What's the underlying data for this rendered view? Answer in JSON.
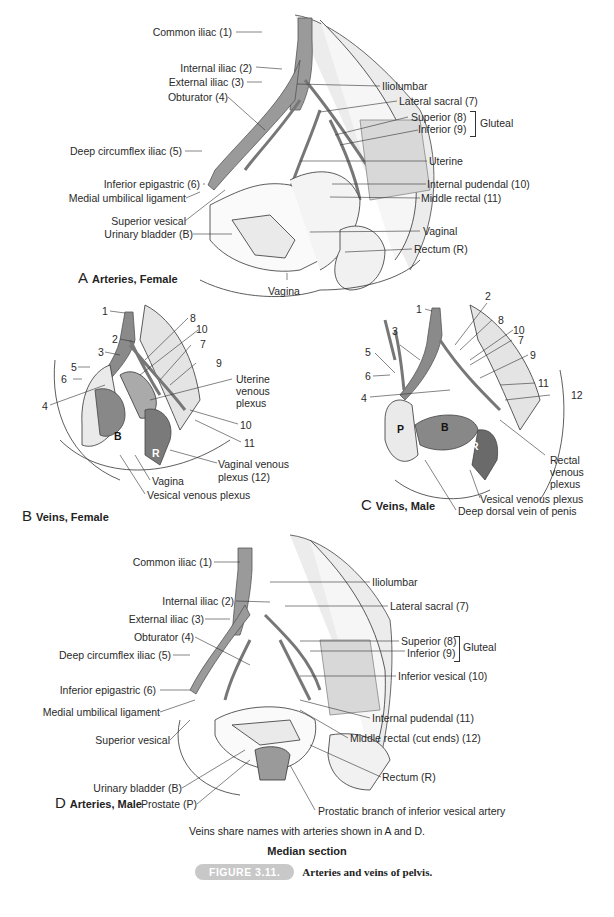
{
  "panels": {
    "A": {
      "letter": "A",
      "title": "Arteries, Female",
      "labels": {
        "common_iliac": "Common iliac (1)",
        "internal_iliac": "Internal iliac (2)",
        "external_iliac": "External iliac (3)",
        "obturator": "Obturator (4)",
        "deep_circumflex_iliac": "Deep circumflex iliac (5)",
        "inferior_epigastric": "Inferior epigastric (6)",
        "medial_umbilical_ligament": "Medial umbilical ligament",
        "superior_vesical": "Superior vesical",
        "urinary_bladder": "Urinary bladder (B)",
        "vagina": "Vagina",
        "iliolumbar": "Iliolumbar",
        "lateral_sacral": "Lateral sacral (7)",
        "gluteal_superior": "Superior (8)",
        "gluteal_inferior": "Inferior (9)",
        "gluteal": "Gluteal",
        "uterine": "Uterine",
        "internal_pudendal": "Internal pudendal (10)",
        "middle_rectal": "Middle rectal (11)",
        "vaginal": "Vaginal",
        "rectum": "Rectum (R)"
      }
    },
    "B": {
      "letter": "B",
      "title": "Veins, Female",
      "numbers": [
        "1",
        "2",
        "3",
        "4",
        "5",
        "6",
        "7",
        "8",
        "9",
        "10",
        "10",
        "11"
      ],
      "labels": {
        "uterine_venous_plexus_1": "Uterine",
        "uterine_venous_plexus_2": "venous",
        "uterine_venous_plexus_3": "plexus",
        "vaginal_venous_plexus_1": "Vaginal venous",
        "vaginal_venous_plexus_2": "plexus (12)",
        "vagina": "Vagina",
        "vesical_venous_plexus": "Vesical venous plexus",
        "bladder_marker": "B",
        "rectum_marker": "R"
      }
    },
    "C": {
      "letter": "C",
      "title": "Veins, Male",
      "numbers": [
        "1",
        "2",
        "3",
        "4",
        "5",
        "6",
        "7",
        "8",
        "9",
        "10",
        "11",
        "12"
      ],
      "labels": {
        "rectal_venous_plexus_1": "Rectal",
        "rectal_venous_plexus_2": "venous",
        "rectal_venous_plexus_3": "plexus",
        "vesical_venous_plexus": "Vesical venous plexus",
        "deep_dorsal_vein": "Deep dorsal vein of penis",
        "prostate_marker": "P",
        "bladder_marker": "B",
        "rectum_marker": "R"
      }
    },
    "D": {
      "letter": "D",
      "title": "Arteries, Male",
      "labels": {
        "common_iliac": "Common iliac (1)",
        "internal_iliac": "Internal iliac (2)",
        "external_iliac": "External iliac (3)",
        "obturator": "Obturator (4)",
        "deep_circumflex_iliac": "Deep circumflex iliac (5)",
        "inferior_epigastric": "Inferior epigastric (6)",
        "medial_umbilical_ligament": "Medial umbilical ligament",
        "superior_vesical": "Superior vesical",
        "urinary_bladder": "Urinary bladder (B)",
        "prostate": "Prostate (P)",
        "iliolumbar": "Iliolumbar",
        "lateral_sacral": "Lateral sacral (7)",
        "gluteal_superior": "Superior (8)",
        "gluteal_inferior": "Inferior (9)",
        "gluteal": "Gluteal",
        "inferior_vesical": "Inferior vesical (10)",
        "internal_pudendal": "Internal pudendal (11)",
        "middle_rectal": "Middle rectal (cut ends) (12)",
        "rectum": "Rectum (R)",
        "prostatic_branch": "Prostatic branch of inferior vesical artery"
      }
    }
  },
  "caption": {
    "note": "Veins share names with arteries shown in A and D.",
    "subtitle": "Median section",
    "figure_badge": "FIGURE 3.11.",
    "figure_title": "Arteries and veins of pelvis."
  },
  "colors": {
    "vessel": "#8a8a8a",
    "vessel_dark": "#5a5a5a",
    "bone": "#e6e6e6",
    "organ_shade": "#9a9a9a",
    "badge": "#c8c8c8"
  }
}
